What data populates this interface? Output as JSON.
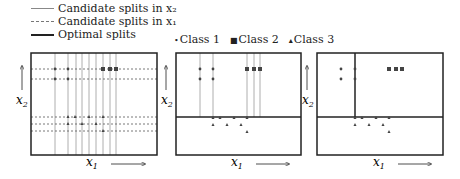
{
  "legend": {
    "items": [
      {
        "label": "Candidate splits in x₂",
        "style": "solid-thin"
      },
      {
        "label": "Candidate splits in x₁",
        "style": "dotted"
      },
      {
        "label": "Optimal splits",
        "style": "solid-thick"
      }
    ]
  },
  "class_legend": {
    "items": [
      {
        "label": "Class 1",
        "marker": "•"
      },
      {
        "label": "Class 2",
        "marker": "■"
      },
      {
        "label": "Class 3",
        "marker": "▴"
      }
    ]
  },
  "axes": {
    "x_label": "x₁",
    "y_label": "x₂"
  },
  "panels": [
    {
      "name": "candidate-splits",
      "box": [
        31,
        53,
        157,
        155
      ]
    },
    {
      "name": "first-optimal-split",
      "box": [
        176,
        53,
        301,
        155
      ]
    },
    {
      "name": "second-optimal-split",
      "box": [
        317,
        53,
        443,
        155
      ]
    }
  ],
  "colors": {
    "box": "#222222",
    "candidate": "#888888",
    "point": "#555555"
  }
}
